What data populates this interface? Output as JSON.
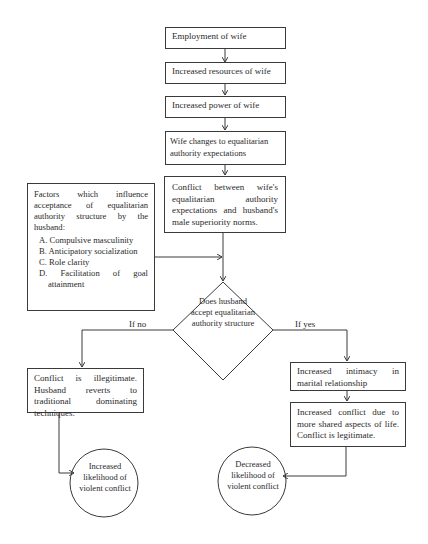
{
  "diagram": {
    "chain": [
      "Employment of wife",
      "Increased resources of wife",
      "Increased power of wife",
      "Wife changes to equalitarian authority expectations",
      "Conflict between wife's equalitarian authority expectations and husband's male superiority norms."
    ],
    "factors": {
      "heading": "Factors which influence acceptance of equalitarian authority structure by the husband:",
      "items": [
        "A. Compulsive masculinity",
        "B. Anticipatory socialization",
        "C. Role clarity",
        "D. Facilitation of goal attainment"
      ]
    },
    "decision": "Does husband accept equalitarian authority structure",
    "branch_no": {
      "label": "If no",
      "box": "Conflict is illegitimate. Husband reverts to traditional dominating techniques.",
      "outcome": "Increased likelihood of violent conflict"
    },
    "branch_yes": {
      "label": "If yes",
      "box1": "Increased intimacy in marital relationship",
      "box2": "Increased conflict due to more shared aspects of life. Conflict is legitimate.",
      "outcome": "Decreased likelihood of violent conflict"
    }
  }
}
